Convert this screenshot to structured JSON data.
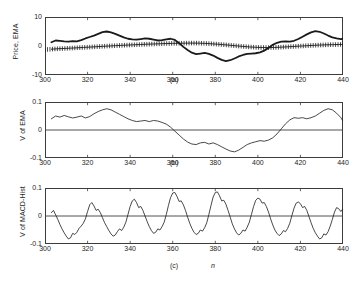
{
  "figure": {
    "background": "#ffffff",
    "axis_color": "#3c3c3c",
    "line_color": "#1a1a1a"
  },
  "chart_data": [
    {
      "type": "line",
      "panel": "a",
      "caption": "(a)",
      "title": "",
      "xlabel": "",
      "ylabel": "Price,  EMA",
      "xlim": [
        300,
        440
      ],
      "ylim": [
        -10,
        10
      ],
      "xticks": [
        300,
        320,
        340,
        360,
        380,
        400,
        420,
        440
      ],
      "yticks": [
        10,
        0,
        -10
      ],
      "ytick_labels": [
        "10",
        "0",
        "-10"
      ],
      "grid": false,
      "legend": "none",
      "series": [
        {
          "name": "Price",
          "style": "thick-solid",
          "linewidth": 1.8,
          "marker": "none",
          "x": [
            303,
            305,
            307,
            309,
            311,
            313,
            315,
            317,
            319,
            321,
            323,
            325,
            327,
            329,
            331,
            333,
            335,
            337,
            339,
            341,
            343,
            345,
            347,
            349,
            351,
            353,
            355,
            357,
            359,
            361,
            363,
            365,
            367,
            369,
            371,
            373,
            375,
            377,
            379,
            381,
            383,
            385,
            387,
            389,
            391,
            393,
            395,
            397,
            399,
            401,
            403,
            405,
            407,
            409,
            411,
            413,
            415,
            417,
            419,
            421,
            423,
            425,
            427,
            429,
            431,
            433,
            435,
            437,
            439,
            440
          ],
          "values": [
            1.3,
            1.9,
            1.8,
            1.6,
            1.5,
            1.7,
            1.6,
            2.0,
            2.6,
            3.1,
            3.6,
            4.2,
            4.8,
            5.0,
            4.7,
            4.2,
            3.6,
            3.0,
            2.5,
            2.3,
            2.2,
            2.4,
            2.6,
            2.5,
            2.2,
            1.9,
            2.0,
            2.3,
            2.5,
            2.1,
            1.0,
            -0.3,
            -1.4,
            -2.3,
            -2.8,
            -2.6,
            -2.4,
            -2.7,
            -3.3,
            -4.1,
            -4.8,
            -5.2,
            -4.9,
            -4.3,
            -3.6,
            -3.1,
            -2.7,
            -2.6,
            -2.5,
            -2.2,
            -1.6,
            -0.7,
            0.4,
            1.1,
            1.5,
            1.6,
            1.5,
            1.8,
            2.4,
            3.2,
            4.0,
            4.7,
            5.1,
            4.9,
            4.3,
            3.6,
            3.0,
            2.6,
            2.4,
            2.5
          ]
        },
        {
          "name": "EMA",
          "style": "thin-solid-with-plus-markers",
          "linewidth": 0.9,
          "marker": "plus",
          "x": [
            303,
            306,
            309,
            312,
            315,
            318,
            321,
            324,
            327,
            330,
            333,
            336,
            339,
            342,
            345,
            348,
            351,
            354,
            357,
            360,
            363,
            366,
            369,
            372,
            375,
            378,
            381,
            384,
            387,
            390,
            393,
            396,
            399,
            402,
            405,
            408,
            411,
            414,
            417,
            420,
            423,
            426,
            429,
            432,
            435,
            438,
            440
          ],
          "values": [
            -1.1,
            -0.95,
            -0.85,
            -0.75,
            -0.62,
            -0.5,
            -0.38,
            -0.25,
            -0.12,
            0.0,
            0.12,
            0.22,
            0.32,
            0.42,
            0.52,
            0.62,
            0.7,
            0.78,
            0.85,
            0.9,
            0.95,
            0.98,
            1.0,
            0.98,
            0.9,
            0.78,
            0.62,
            0.45,
            0.25,
            0.05,
            -0.15,
            -0.32,
            -0.45,
            -0.52,
            -0.55,
            -0.5,
            -0.4,
            -0.28,
            -0.15,
            -0.02,
            0.1,
            0.22,
            0.32,
            0.4,
            0.46,
            0.52,
            0.55
          ]
        }
      ]
    },
    {
      "type": "line",
      "panel": "b",
      "caption": "(b)",
      "title": "",
      "xlabel": "",
      "ylabel": "V of EMA",
      "xlim": [
        300,
        440
      ],
      "ylim": [
        -0.1,
        0.1
      ],
      "xticks": [
        300,
        320,
        340,
        360,
        380,
        400,
        420,
        440
      ],
      "yticks": [
        0.1,
        0,
        -0.1
      ],
      "ytick_labels": [
        "0.1",
        "0",
        "-0.1"
      ],
      "grid": false,
      "legend": "none",
      "zero_line": true,
      "series": [
        {
          "name": "V of EMA",
          "style": "thin-solid",
          "linewidth": 0.8,
          "marker": "none",
          "x": [
            303,
            305,
            307,
            309,
            311,
            313,
            315,
            317,
            319,
            321,
            323,
            325,
            327,
            329,
            331,
            333,
            335,
            337,
            339,
            341,
            343,
            345,
            347,
            349,
            351,
            353,
            355,
            357,
            359,
            361,
            363,
            365,
            367,
            369,
            371,
            373,
            375,
            377,
            379,
            381,
            383,
            385,
            387,
            389,
            391,
            393,
            395,
            397,
            399,
            401,
            403,
            405,
            407,
            409,
            411,
            413,
            415,
            417,
            419,
            421,
            423,
            425,
            427,
            429,
            431,
            433,
            435,
            437,
            439,
            440
          ],
          "values": [
            0.04,
            0.05,
            0.046,
            0.052,
            0.047,
            0.043,
            0.046,
            0.05,
            0.043,
            0.048,
            0.058,
            0.066,
            0.072,
            0.076,
            0.072,
            0.064,
            0.056,
            0.048,
            0.04,
            0.034,
            0.03,
            0.032,
            0.034,
            0.03,
            0.034,
            0.032,
            0.027,
            0.021,
            0.01,
            -0.004,
            -0.018,
            -0.032,
            -0.043,
            -0.05,
            -0.052,
            -0.046,
            -0.044,
            -0.05,
            -0.046,
            -0.052,
            -0.06,
            -0.068,
            -0.075,
            -0.078,
            -0.072,
            -0.062,
            -0.052,
            -0.046,
            -0.042,
            -0.038,
            -0.04,
            -0.036,
            -0.028,
            -0.014,
            0.004,
            0.022,
            0.036,
            0.044,
            0.042,
            0.044,
            0.04,
            0.044,
            0.05,
            0.06,
            0.07,
            0.076,
            0.072,
            0.06,
            0.044,
            0.032
          ]
        }
      ]
    },
    {
      "type": "line",
      "panel": "c",
      "caption": "(c)",
      "title": "",
      "xlabel": "n",
      "ylabel": "V of MACD-Hist",
      "xlim": [
        300,
        440
      ],
      "ylim": [
        -0.1,
        0.1
      ],
      "xticks": [
        300,
        320,
        340,
        360,
        380,
        400,
        420,
        440
      ],
      "yticks": [
        0.1,
        0,
        -0.1
      ],
      "ytick_labels": [
        "0.1",
        "0",
        "-0.1"
      ],
      "grid": false,
      "legend": "none",
      "zero_line": true,
      "period": 20,
      "series": [
        {
          "name": "V of MACD-Hist",
          "style": "thin-solid",
          "linewidth": 0.8,
          "marker": "none",
          "x": [
            303,
            304,
            305,
            306,
            307,
            308,
            309,
            310,
            311,
            312,
            313,
            314,
            315,
            316,
            317,
            318,
            319,
            320,
            321,
            322,
            323,
            324,
            325,
            326,
            327,
            328,
            329,
            330,
            331,
            332,
            333,
            334,
            335,
            336,
            337,
            338,
            339,
            340,
            341,
            342,
            343,
            344,
            345,
            346,
            347,
            348,
            349,
            350,
            351,
            352,
            353,
            354,
            355,
            356,
            357,
            358,
            359,
            360,
            361,
            362,
            363,
            364,
            365,
            366,
            367,
            368,
            369,
            370,
            371,
            372,
            373,
            374,
            375,
            376,
            377,
            378,
            379,
            380,
            381,
            382,
            383,
            384,
            385,
            386,
            387,
            388,
            389,
            390,
            391,
            392,
            393,
            394,
            395,
            396,
            397,
            398,
            399,
            400,
            401,
            402,
            403,
            404,
            405,
            406,
            407,
            408,
            409,
            410,
            411,
            412,
            413,
            414,
            415,
            416,
            417,
            418,
            419,
            420,
            421,
            422,
            423,
            424,
            425,
            426,
            427,
            428,
            429,
            430,
            431,
            432,
            433,
            434,
            435,
            436,
            437,
            438,
            439,
            440
          ],
          "values": [
            0.012,
            0.02,
            0.004,
            -0.012,
            -0.03,
            -0.046,
            -0.06,
            -0.072,
            -0.082,
            -0.078,
            -0.062,
            -0.066,
            -0.058,
            -0.044,
            -0.036,
            -0.026,
            -0.01,
            0.016,
            0.04,
            0.048,
            0.036,
            0.02,
            0.024,
            0.012,
            -0.006,
            -0.024,
            -0.038,
            -0.052,
            -0.064,
            -0.072,
            -0.068,
            -0.056,
            -0.046,
            -0.052,
            -0.04,
            -0.022,
            0.006,
            0.034,
            0.054,
            0.06,
            0.048,
            0.03,
            0.034,
            0.02,
            0.0,
            -0.02,
            -0.038,
            -0.052,
            -0.062,
            -0.058,
            -0.046,
            -0.05,
            -0.038,
            -0.022,
            0.006,
            0.038,
            0.066,
            0.082,
            0.084,
            0.07,
            0.052,
            0.054,
            0.04,
            0.02,
            -0.004,
            -0.026,
            -0.044,
            -0.058,
            -0.066,
            -0.062,
            -0.05,
            -0.054,
            -0.042,
            -0.024,
            0.006,
            0.038,
            0.068,
            0.084,
            0.086,
            0.072,
            0.054,
            0.056,
            0.042,
            0.02,
            -0.004,
            -0.028,
            -0.046,
            -0.06,
            -0.068,
            -0.062,
            -0.05,
            -0.054,
            -0.04,
            -0.022,
            0.006,
            0.034,
            0.056,
            0.064,
            0.06,
            0.046,
            0.048,
            0.034,
            0.014,
            -0.01,
            -0.032,
            -0.05,
            -0.062,
            -0.07,
            -0.064,
            -0.052,
            -0.056,
            -0.044,
            -0.026,
            0.002,
            0.028,
            0.046,
            0.05,
            0.044,
            0.03,
            0.034,
            0.02,
            -0.002,
            -0.024,
            -0.044,
            -0.06,
            -0.072,
            -0.082,
            -0.078,
            -0.064,
            -0.068,
            -0.056,
            -0.036,
            -0.012,
            0.014,
            0.03,
            0.026,
            0.016,
            0.026,
            0.038,
            0.05
          ]
        }
      ]
    }
  ]
}
